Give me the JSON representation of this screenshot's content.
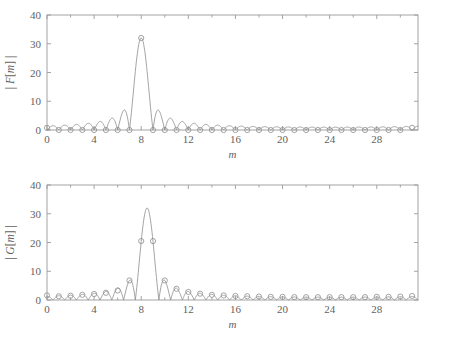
{
  "figure": {
    "background_color": "#ffffff",
    "line_color": "#8d8d8d",
    "axis_color": "#9a9a9a",
    "text_color": "#5f5f5f"
  },
  "chart_data": [
    {
      "type": "line",
      "id": "magnitude-F",
      "title": "",
      "xlabel": "m",
      "ylabel": "|F[m]|",
      "ylabel_parts": {
        "bar_left": "|",
        "func": "F",
        "bracket_open": "[",
        "index": "m",
        "bracket_close": "]",
        "bar_right": "|"
      },
      "xlim": [
        0,
        31.5
      ],
      "ylim": [
        0,
        40
      ],
      "xticks": [
        0,
        4,
        8,
        12,
        16,
        20,
        24,
        28
      ],
      "xticklabels": [
        "0",
        "4",
        "8",
        "12",
        "16",
        "20",
        "24",
        "28"
      ],
      "xminorticks": [
        2,
        6,
        10,
        14,
        18,
        22,
        26,
        30
      ],
      "yticks": [
        0,
        10,
        20,
        30,
        40
      ],
      "yticklabels": [
        "0",
        "10",
        "20",
        "30",
        "40"
      ],
      "grid": false,
      "legend": false,
      "marker": "circle",
      "series": [
        {
          "name": "|F[m]| samples",
          "x": [
            0,
            1,
            2,
            3,
            4,
            5,
            6,
            7,
            8,
            9,
            10,
            11,
            12,
            13,
            14,
            15,
            16,
            17,
            18,
            19,
            20,
            21,
            22,
            23,
            24,
            25,
            26,
            27,
            28,
            29,
            30,
            31
          ],
          "values": [
            0.75,
            0.0,
            0.0,
            0.0,
            0.0,
            0.0,
            0.0,
            0.0,
            32.0,
            0.0,
            0.0,
            0.0,
            0.0,
            0.0,
            0.0,
            0.0,
            0.0,
            0.0,
            0.0,
            0.0,
            0.0,
            0.0,
            0.0,
            0.0,
            0.0,
            0.0,
            0.0,
            0.0,
            0.0,
            0.0,
            0.0,
            0.75
          ]
        }
      ],
      "envelope": {
        "description": "Dirichlet kernel magnitude, N=32, centred at m=8",
        "N": 32,
        "amplitude": 32,
        "center": 8,
        "samples_per_unit": 24
      }
    },
    {
      "type": "line",
      "id": "magnitude-G",
      "title": "",
      "xlabel": "m",
      "ylabel": "|G[m]|",
      "ylabel_parts": {
        "bar_left": "|",
        "func": "G",
        "bracket_open": "[",
        "index": "m",
        "bracket_close": "]",
        "bar_right": "|"
      },
      "xlim": [
        0,
        31.5
      ],
      "ylim": [
        0,
        40
      ],
      "xticks": [
        0,
        4,
        8,
        12,
        16,
        20,
        24,
        28
      ],
      "xticklabels": [
        "0",
        "4",
        "8",
        "12",
        "16",
        "20",
        "24",
        "28"
      ],
      "xminorticks": [
        2,
        6,
        10,
        14,
        18,
        22,
        26,
        30
      ],
      "yticks": [
        0,
        10,
        20,
        30,
        40
      ],
      "yticklabels": [
        "0",
        "10",
        "20",
        "30",
        "40"
      ],
      "grid": false,
      "legend": false,
      "marker": "circle",
      "series": [
        {
          "name": "|G[m]| samples",
          "x": [
            0,
            1,
            2,
            3,
            4,
            5,
            6,
            7,
            8,
            9,
            10,
            11,
            12,
            13,
            14,
            15,
            16,
            17,
            18,
            19,
            20,
            21,
            22,
            23,
            24,
            25,
            26,
            27,
            28,
            29,
            30,
            31
          ],
          "values": [
            1.6,
            1.3,
            1.5,
            1.8,
            2.1,
            2.5,
            3.3,
            6.8,
            20.5,
            20.5,
            6.8,
            3.9,
            2.8,
            2.2,
            1.8,
            1.6,
            1.4,
            1.3,
            1.2,
            1.1,
            1.1,
            1.0,
            1.0,
            1.0,
            1.0,
            1.0,
            1.0,
            1.0,
            1.1,
            1.1,
            1.2,
            1.4
          ]
        }
      ],
      "envelope": {
        "description": "Dirichlet kernel magnitude, N=32, centred at m=8.5",
        "N": 32,
        "amplitude": 32,
        "center": 8.5,
        "samples_per_unit": 24
      }
    }
  ]
}
